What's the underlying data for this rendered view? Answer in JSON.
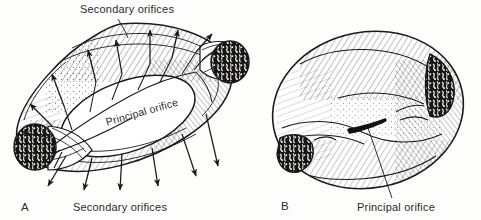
{
  "figure": {
    "type": "scientific-line-illustration",
    "medium": "pen-and-ink hatched drawing",
    "background_color": "#fdfdfb",
    "ink_color": "#1a1a1a",
    "panels": [
      {
        "letter": "A",
        "description": "cut-away ring-shaped body seen from above showing the large oval principal orifice, two severed tube ends, and arrows radiating outward from the secondary orifices",
        "labels": [
          "Secondary orifices",
          "Principal orifice",
          "Secondary orifices"
        ]
      },
      {
        "letter": "B",
        "description": "intact ovoid body with a dark slit-like principal orifice and mottled cut surfaces at each side",
        "labels": [
          "Principal orifice"
        ]
      }
    ]
  },
  "labels": {
    "secondary_orifices_top": "Secondary orifices",
    "secondary_orifices_bottom": "Secondary orifices",
    "principal_orifice_a": "Principal orifice",
    "principal_orifice_b": "Principal orifice",
    "panel_a_letter": "A",
    "panel_b_letter": "B"
  },
  "colors": {
    "ink": "#1a1a1a",
    "paper": "#fdfdfb",
    "text": "#2b2b2b",
    "slit_fill": "#111111"
  }
}
